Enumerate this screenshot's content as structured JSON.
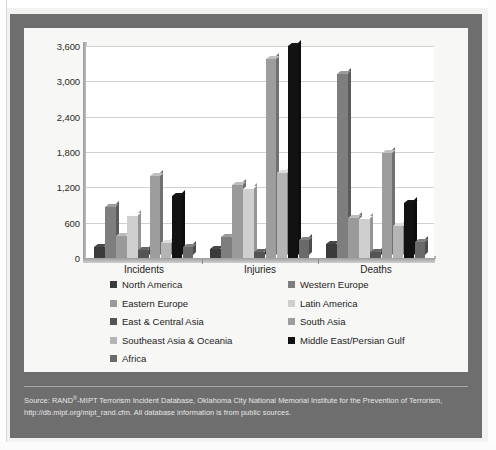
{
  "figure": {
    "panel_background": "#6e6e6e",
    "card_background": "#f7f7f5"
  },
  "axis": {
    "y_ticks": [
      "0",
      "600",
      "1,200",
      "1,800",
      "2,400",
      "3,000",
      "3,600"
    ]
  },
  "source": {
    "line1_pre": "Source: RAND",
    "line1_sup": "®",
    "line1_post": "-MIPT Terrorism Incident Database, Oklahoma City National Memorial Institute for the Prevention of Terrorism,",
    "line2": "http://db.mipt.org/mipt_rand.cfm. All database information is from public sources."
  },
  "legend": {
    "entries": [
      {
        "label": "North America",
        "color": "#3b3b3b",
        "col": 0,
        "row": 0
      },
      {
        "label": "Western Europe",
        "color": "#7e7e7e",
        "col": 1,
        "row": 0
      },
      {
        "label": "Eastern Europe",
        "color": "#9a9a9a",
        "col": 0,
        "row": 1
      },
      {
        "label": "Latin America",
        "color": "#cfcfcf",
        "col": 1,
        "row": 1
      },
      {
        "label": "East & Central Asia",
        "color": "#545454",
        "col": 0,
        "row": 2
      },
      {
        "label": "South Asia",
        "color": "#9d9d9d",
        "col": 1,
        "row": 2
      },
      {
        "label": "Southeast Asia & Oceania",
        "color": "#b5b5b5",
        "col": 0,
        "row": 3
      },
      {
        "label": "Middle East/Persian Gulf",
        "color": "#121212",
        "col": 1,
        "row": 3
      },
      {
        "label": "Africa",
        "color": "#6a6a6a",
        "col": 0,
        "row": 4
      }
    ]
  },
  "chart_data": {
    "type": "bar",
    "title": "",
    "xlabel": "",
    "ylabel": "",
    "ylim": [
      0,
      3600
    ],
    "ytick_interval": 600,
    "grid": true,
    "legend_position": "below-plot",
    "categories": [
      "Incidents",
      "Injuries",
      "Deaths"
    ],
    "series": [
      {
        "name": "North America",
        "color": "#3b3b3b",
        "values": [
          180,
          160,
          230
        ]
      },
      {
        "name": "Western Europe",
        "color": "#7e7e7e",
        "values": [
          870,
          350,
          3130
        ]
      },
      {
        "name": "Eastern Europe",
        "color": "#9a9a9a",
        "values": [
          380,
          1240,
          680
        ]
      },
      {
        "name": "Latin America",
        "color": "#cfcfcf",
        "values": [
          720,
          1180,
          670
        ]
      },
      {
        "name": "East & Central Asia",
        "color": "#545454",
        "values": [
          130,
          110,
          110
        ]
      },
      {
        "name": "South Asia",
        "color": "#9d9d9d",
        "values": [
          1400,
          3380,
          1780
        ]
      },
      {
        "name": "Southeast Asia & Oceania",
        "color": "#b5b5b5",
        "values": [
          250,
          1440,
          550
        ]
      },
      {
        "name": "Middle East/Persian Gulf",
        "color": "#121212",
        "values": [
          1050,
          3600,
          930
        ]
      },
      {
        "name": "Africa",
        "color": "#6a6a6a",
        "values": [
          180,
          300,
          280
        ]
      }
    ]
  }
}
